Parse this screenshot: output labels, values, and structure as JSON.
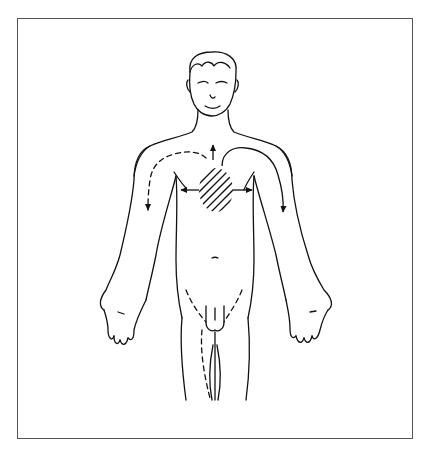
{
  "figure": {
    "pain_region": {
      "location": "central chest / sternum",
      "pattern": "diagonal hatching"
    },
    "radiation_paths": [
      {
        "to": "neck / jaw",
        "style": "solid arrow",
        "direction": "up"
      },
      {
        "to": "left arm (inner)",
        "style": "solid curved arrow",
        "direction": "down left arm"
      },
      {
        "to": "right arm (inner)",
        "style": "dashed curved arrow",
        "direction": "down right arm"
      },
      {
        "to": "left chest",
        "style": "solid arrow",
        "direction": "lateral"
      },
      {
        "to": "right chest",
        "style": "solid arrow",
        "direction": "lateral"
      }
    ],
    "colors": {
      "line": "#111111",
      "frame": "#555555",
      "background": "#ffffff"
    }
  }
}
